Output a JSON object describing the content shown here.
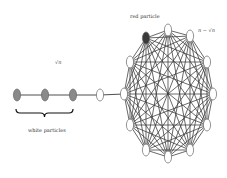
{
  "diagram": {
    "type": "lollipop-graph",
    "labels": {
      "red_particle": "red particle",
      "clique_size": "n − √n",
      "chain_length": "√n",
      "white_particles": "white particles"
    },
    "colors": {
      "edge": "#3a3a3a",
      "node_white_fill": "#ffffff",
      "node_grey_fill": "#8a8a8a",
      "node_red_fill": "#3a3a3a",
      "node_stroke": "#666666"
    },
    "chain": {
      "y": 95,
      "nodes": [
        {
          "x": 17,
          "kind": "grey"
        },
        {
          "x": 45,
          "kind": "grey"
        },
        {
          "x": 73,
          "kind": "grey"
        },
        {
          "x": 100,
          "kind": "white"
        }
      ],
      "brace": {
        "x1": 16,
        "x2": 73,
        "y": 113
      }
    },
    "clique": {
      "center": [
        168,
        94
      ],
      "nodes": [
        {
          "x": 168,
          "y": 30,
          "kind": "white"
        },
        {
          "x": 190,
          "y": 36,
          "kind": "white"
        },
        {
          "x": 207,
          "y": 62,
          "kind": "white"
        },
        {
          "x": 213,
          "y": 94,
          "kind": "white"
        },
        {
          "x": 207,
          "y": 125,
          "kind": "white"
        },
        {
          "x": 190,
          "y": 150,
          "kind": "white"
        },
        {
          "x": 168,
          "y": 157,
          "kind": "white"
        },
        {
          "x": 146,
          "y": 150,
          "kind": "white"
        },
        {
          "x": 130,
          "y": 125,
          "kind": "white"
        },
        {
          "x": 124,
          "y": 94,
          "kind": "white"
        },
        {
          "x": 130,
          "y": 62,
          "kind": "white"
        },
        {
          "x": 146,
          "y": 38,
          "kind": "red"
        }
      ]
    }
  }
}
